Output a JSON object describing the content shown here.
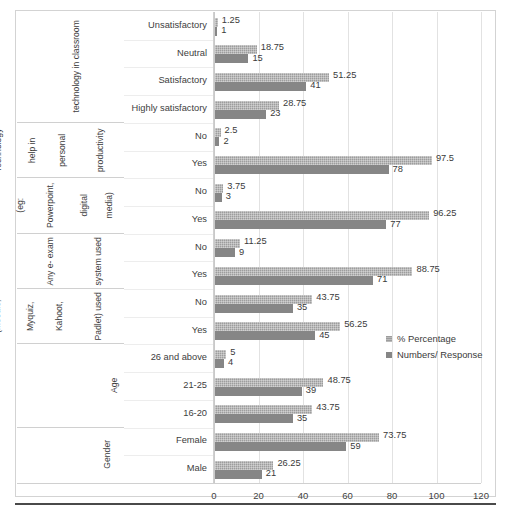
{
  "chart_data": {
    "type": "bar",
    "orientation": "horizontal",
    "title": "",
    "xlabel": "",
    "ylabel": "",
    "xlim": [
      0,
      120
    ],
    "xticks": [
      0,
      20,
      40,
      60,
      80,
      100,
      120
    ],
    "grid": true,
    "legend_position": "center-right",
    "series": [
      {
        "name": "% Percentage",
        "color": "#9d9d9d",
        "values": [
          1.25,
          18.75,
          51.25,
          28.75,
          2.5,
          97.5,
          3.75,
          96.25,
          11.25,
          88.75,
          43.75,
          56.25,
          5,
          48.75,
          43.75,
          73.75,
          26.25
        ]
      },
      {
        "name": "Numbers/ Response",
        "color": "#868686",
        "values": [
          1,
          15,
          41,
          23,
          2,
          78,
          3,
          77,
          9,
          71,
          35,
          45,
          4,
          39,
          35,
          59,
          21
        ]
      }
    ],
    "categories": [
      "Unsatisfactory",
      "Neutral",
      "Satisfactory",
      "Highly satisfactory",
      "No",
      "Yes",
      "No",
      "Yes",
      "No",
      "Yes",
      "No",
      "Yes",
      "26 and above",
      "21-25",
      "16-20",
      "Female",
      "Male"
    ],
    "groups": [
      {
        "label": "Level of Satisfaction using technology in classroom",
        "lines": [
          "Level of Satisfaction using",
          "technology in classroom"
        ],
        "categories": [
          "Unsatisfactory",
          "Neutral",
          "Satisfactory",
          "Highly satisfactory"
        ]
      },
      {
        "label": "Technology help in personal productivity",
        "lines": [
          "Technology",
          "help in",
          "personal",
          "productivity"
        ],
        "categories": [
          "No",
          "Yes"
        ]
      },
      {
        "label": "Technology for information presentation (eg: Powerpoint, digital media)",
        "lines": [
          "Technology",
          "for",
          "information",
          "presentation",
          "(eg:",
          "Powerpoint,",
          "digital",
          "media)"
        ],
        "categories": [
          "No",
          "Yes"
        ]
      },
      {
        "label": "Any e- exam system used",
        "lines": [
          "Any e- exam",
          "system used"
        ],
        "categories": [
          "No",
          "Yes"
        ]
      },
      {
        "label": "ICT tools such as (Moodle, Myquiz, Kahoot, Padlet) used",
        "lines": [
          "ICT tools",
          "such as",
          "(Moodle,",
          "Myquiz,",
          "Kahoot,",
          "Padlet) used"
        ],
        "categories": [
          "No",
          "Yes"
        ]
      },
      {
        "label": "Age",
        "lines": [
          "Age"
        ],
        "categories": [
          "26 and above",
          "21-25",
          "16-20"
        ]
      },
      {
        "label": "Gender",
        "lines": [
          "Gender"
        ],
        "categories": [
          "Female",
          "Male"
        ]
      }
    ],
    "rows": [
      {
        "group": "Level of Satisfaction using technology in classroom",
        "category": "Unsatisfactory",
        "percentage": 1.25,
        "numbers": 1
      },
      {
        "group": "Level of Satisfaction using technology in classroom",
        "category": "Neutral",
        "percentage": 18.75,
        "numbers": 15
      },
      {
        "group": "Level of Satisfaction using technology in classroom",
        "category": "Satisfactory",
        "percentage": 51.25,
        "numbers": 41
      },
      {
        "group": "Level of Satisfaction using technology in classroom",
        "category": "Highly satisfactory",
        "percentage": 28.75,
        "numbers": 23
      },
      {
        "group": "Technology help in personal productivity",
        "category": "No",
        "percentage": 2.5,
        "numbers": 2
      },
      {
        "group": "Technology help in personal productivity",
        "category": "Yes",
        "percentage": 97.5,
        "numbers": 78
      },
      {
        "group": "Technology for information presentation (eg: Powerpoint, digital media)",
        "category": "No",
        "percentage": 3.75,
        "numbers": 3
      },
      {
        "group": "Technology for information presentation (eg: Powerpoint, digital media)",
        "category": "Yes",
        "percentage": 96.25,
        "numbers": 77
      },
      {
        "group": "Any e- exam system used",
        "category": "No",
        "percentage": 11.25,
        "numbers": 9
      },
      {
        "group": "Any e- exam system used",
        "category": "Yes",
        "percentage": 88.75,
        "numbers": 71
      },
      {
        "group": "ICT tools such as (Moodle, Myquiz, Kahoot, Padlet) used",
        "category": "No",
        "percentage": 43.75,
        "numbers": 35
      },
      {
        "group": "ICT tools such as (Moodle, Myquiz, Kahoot, Padlet) used",
        "category": "Yes",
        "percentage": 56.25,
        "numbers": 45
      },
      {
        "group": "Age",
        "category": "26 and above",
        "percentage": 5,
        "numbers": 4
      },
      {
        "group": "Age",
        "category": "21-25",
        "percentage": 48.75,
        "numbers": 39
      },
      {
        "group": "Age",
        "category": "16-20",
        "percentage": 43.75,
        "numbers": 35
      },
      {
        "group": "Gender",
        "category": "Female",
        "percentage": 73.75,
        "numbers": 59
      },
      {
        "group": "Gender",
        "category": "Male",
        "percentage": 26.25,
        "numbers": 21
      }
    ]
  },
  "legend": {
    "items": [
      {
        "label": "% Percentage"
      },
      {
        "label": "Numbers/ Response"
      }
    ]
  },
  "colors": {
    "percentage_bar": "#9d9d9d",
    "numbers_bar": "#868686",
    "gridline": "#e2e2e2",
    "frame": "#d3d3d3",
    "rule": "#4a4a4a"
  }
}
